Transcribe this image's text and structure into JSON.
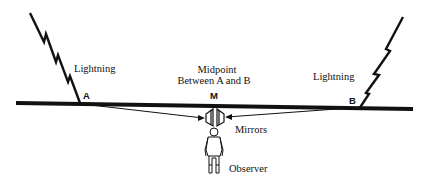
{
  "diagram": {
    "labels": {
      "lightning_left": "Lightning",
      "lightning_right": "Lightning",
      "midpoint_line1": "Midpoint",
      "midpoint_line2": "Between A and B",
      "point_a": "A",
      "point_m": "M",
      "point_b": "B",
      "mirrors": "Mirrors",
      "observer": "Observer"
    },
    "colors": {
      "ink": "#111111",
      "background": "#ffffff"
    }
  }
}
